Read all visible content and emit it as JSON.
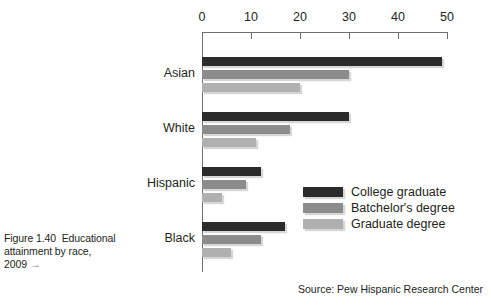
{
  "figure": {
    "caption_line1": "Figure 1.40  Educational",
    "caption_line2": "attainment by race,",
    "caption_line3": "2009",
    "caption_arrow": "→"
  },
  "source": {
    "text": "Source: Pew Hispanic Research Center"
  },
  "legend": {
    "position": "inside-right",
    "items": [
      {
        "label": "College graduate",
        "color": "#2b2b2b"
      },
      {
        "label": "Batchelor's degree",
        "color": "#8c8c8c"
      },
      {
        "label": "Graduate degree",
        "color": "#b0b0b0"
      }
    ]
  },
  "chart_data": {
    "type": "bar",
    "orientation": "horizontal",
    "title": "",
    "xlabel": "",
    "ylabel": "",
    "xlim": [
      0,
      50
    ],
    "grid": false,
    "axis_position": "top",
    "xticks": [
      0,
      10,
      20,
      30,
      40,
      50
    ],
    "xtick_labels": [
      "0",
      "10",
      "20",
      "30",
      "40",
      "50"
    ],
    "categories": [
      "Asian",
      "White",
      "Hispanic",
      "Black"
    ],
    "series": [
      {
        "name": "College graduate",
        "color": "#2b2b2b",
        "values": [
          49,
          30,
          12,
          17
        ]
      },
      {
        "name": "Batchelor's degree",
        "color": "#8c8c8c",
        "values": [
          30,
          18,
          9,
          12
        ]
      },
      {
        "name": "Graduate degree",
        "color": "#b0b0b0",
        "values": [
          20,
          11,
          4,
          6
        ]
      }
    ]
  }
}
